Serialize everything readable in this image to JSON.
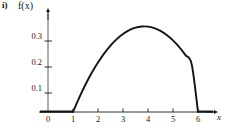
{
  "figure": {
    "part_label": "i)",
    "y_axis_title": "f(x)",
    "x_axis_title": "x"
  },
  "chart_data": {
    "type": "line",
    "title": "",
    "subtitle": "",
    "xlabel": "x",
    "ylabel": "f(x)",
    "xlim": [
      -0.4,
      6.9
    ],
    "ylim": [
      0,
      0.345
    ],
    "grid": false,
    "legend": null,
    "x_ticks": [
      0,
      1,
      2,
      3,
      4,
      5,
      6
    ],
    "x_tick_labels": [
      "0",
      "1",
      "2",
      "3",
      "4",
      "5",
      "6"
    ],
    "y_ticks": [
      0.1,
      0.2,
      0.3
    ],
    "y_tick_labels": [
      "0.1",
      "0.2",
      "0.3"
    ],
    "series": [
      {
        "name": "f(x)",
        "color": "#1a1a1a",
        "description": "Downward parabola supported on [1, 6], zero elsewhere",
        "x": [
          -0.4,
          0.0,
          0.5,
          1.0,
          1.25,
          1.5,
          1.75,
          2.0,
          2.25,
          2.5,
          2.75,
          3.0,
          3.25,
          3.5,
          3.75,
          4.0,
          4.25,
          4.5,
          4.75,
          5.0,
          5.25,
          5.5,
          5.75,
          6.0,
          6.5,
          6.9
        ],
        "y": [
          0.0,
          0.0,
          0.0,
          0.0,
          0.0553,
          0.1056,
          0.1507,
          0.1907,
          0.2257,
          0.2556,
          0.2804,
          0.3001,
          0.3148,
          0.3244,
          0.3289,
          0.3284,
          0.3228,
          0.3121,
          0.2964,
          0.2756,
          0.2497,
          0.2188,
          0.1828,
          0.0,
          0.0,
          0.0
        ]
      }
    ],
    "annotations": [
      {
        "text": "i)",
        "position": "top-left",
        "bold": true
      }
    ],
    "axis_arrows": {
      "x": "right",
      "y": "up"
    }
  }
}
